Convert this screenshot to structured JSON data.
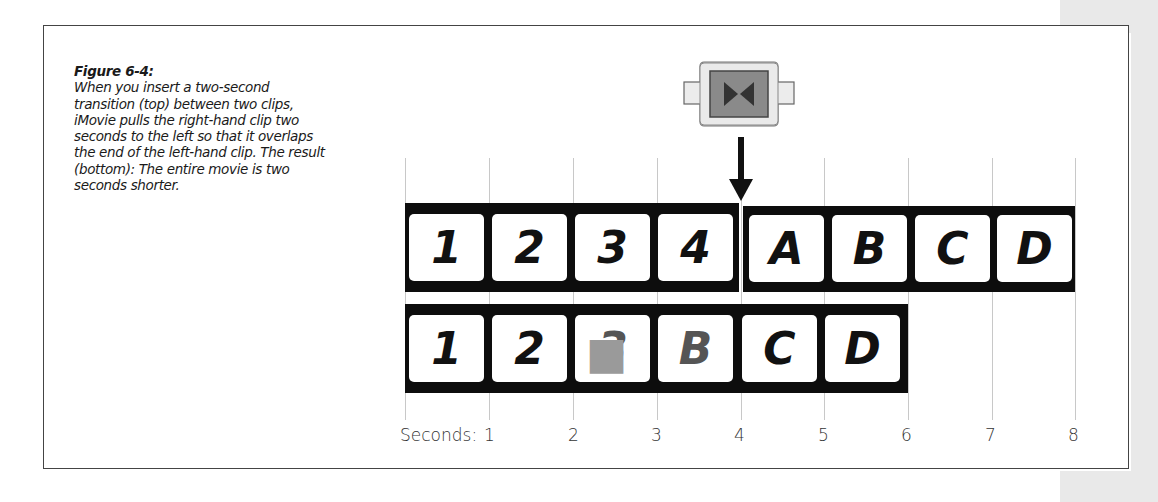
{
  "figure": {
    "title": "Figure 6-4:",
    "caption": "When you insert a two-second transition (top) between two clips, iMovie pulls the right-hand clip two seconds to the left so that it overlaps the end of the left-hand clip. The result (bottom): The entire movie is two seconds shorter."
  },
  "transition_icon": "transition-icon",
  "top_strip": {
    "left_clip": [
      "1",
      "2",
      "3",
      "4"
    ],
    "right_clip": [
      "A",
      "B",
      "C",
      "D"
    ]
  },
  "bottom_strip": {
    "frames": [
      "1",
      "2",
      "3",
      "B",
      "C",
      "D"
    ],
    "blended_frames": [
      2,
      3
    ]
  },
  "axis": {
    "prefix": "Seconds:",
    "ticks": [
      "1",
      "2",
      "3",
      "4",
      "5",
      "6",
      "7",
      "8"
    ]
  }
}
